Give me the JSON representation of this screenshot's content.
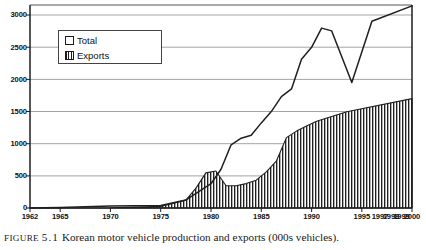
{
  "figure": {
    "caption_prefix": "FIGURE",
    "caption_number": "5.1",
    "caption_text": "Korean motor vehicle production and exports (000s vehicles)."
  },
  "legend": {
    "position": "inside-top-left",
    "items": [
      {
        "label": "Total",
        "swatch": "empty-square"
      },
      {
        "label": "Exports",
        "swatch": "hatched-square"
      }
    ]
  },
  "chart_data": {
    "type": "area",
    "title": "Korean motor vehicle production and exports (000s vehicles).",
    "xlabel": "",
    "ylabel": "",
    "grid": true,
    "legend_position": "inside-top-left",
    "ylim": [
      0,
      3250
    ],
    "yticks": [
      0,
      500,
      1000,
      1500,
      2000,
      2500,
      3000
    ],
    "xlim": [
      1962,
      2000
    ],
    "xticks": [
      1962,
      1965,
      1970,
      1975,
      1980,
      1985,
      1990,
      1995,
      1997,
      1998,
      1999,
      2000
    ],
    "x": [
      1962,
      1965,
      1970,
      1975,
      1980,
      1985,
      1986,
      1987,
      1988,
      1989,
      1990,
      1991,
      1992,
      1993,
      1994,
      1995,
      1996,
      1997,
      1998,
      1999,
      2000
    ],
    "series": [
      {
        "name": "Total",
        "style": "line",
        "values": [
          2,
          10,
          29,
          37,
          123,
          378,
          601,
          980,
          1083,
          1129,
          1322,
          1498,
          1730,
          1851,
          2312,
          2510,
          2813,
          2760,
          1950,
          2900,
          3140
        ]
      },
      {
        "name": "Exports",
        "style": "hatched-area",
        "values": [
          0,
          0,
          0,
          1,
          25,
          123,
          306,
          546,
          576,
          347,
          347,
          379,
          433,
          573,
          738,
          1110,
          1210,
          1290,
          1362,
          1510,
          1700
        ]
      }
    ]
  },
  "axis": {
    "ytick_labels": [
      "3000",
      "2500",
      "2000",
      "1500",
      "1000",
      "500",
      "0"
    ],
    "xtick_labels": [
      "1962",
      "1965",
      "1970",
      "1975",
      "1980",
      "1985",
      "1990",
      "1995",
      "1997",
      "1998",
      "1999",
      "2000"
    ]
  }
}
